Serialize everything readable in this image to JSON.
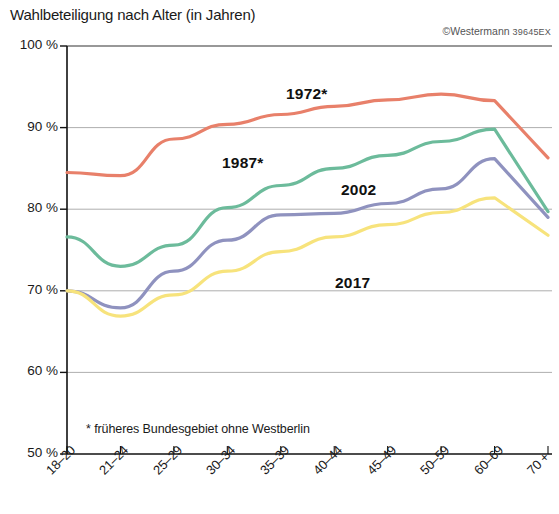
{
  "title": "Wahlbeteiligung nach Alter (in Jahren)",
  "credit": {
    "copy_mark": "©",
    "publisher": "Westermann",
    "code": "39645EX"
  },
  "footnote": "* früheres Bundesgebiet ohne Westberlin",
  "chart_data": {
    "type": "line",
    "title": "Wahlbeteiligung nach Alter (in Jahren)",
    "xlabel": "",
    "ylabel": "",
    "ylim": [
      50,
      100
    ],
    "grid": true,
    "legend_position": "inline-labels",
    "ytick_labels": [
      "100 %",
      "90 %",
      "80 %",
      "70 %",
      "60 %",
      "50 %"
    ],
    "yticks": [
      100,
      90,
      80,
      70,
      60,
      50
    ],
    "categories": [
      "18–20",
      "21–24",
      "25–29",
      "30–34",
      "35–39",
      "40–44",
      "45–49",
      "50–59",
      "60–69",
      "70 +"
    ],
    "series": [
      {
        "name": "1972*",
        "color": "#e8806a",
        "label_x": 286,
        "label_y": 85,
        "values": [
          84.5,
          84.1,
          88.6,
          90.4,
          91.6,
          92.6,
          93.4,
          94.1,
          93.3,
          86.3
        ]
      },
      {
        "name": "1987*",
        "color": "#6cbb9b",
        "label_x": 222,
        "label_y": 154,
        "values": [
          76.6,
          73.0,
          75.6,
          80.2,
          82.9,
          85.0,
          86.6,
          88.3,
          89.8,
          79.7
        ]
      },
      {
        "name": "2002",
        "color": "#8f92bf",
        "label_x": 341,
        "label_y": 181,
        "values": [
          70.0,
          67.9,
          72.4,
          76.2,
          79.3,
          79.5,
          80.7,
          82.5,
          86.2,
          79.0
        ]
      },
      {
        "name": "2017",
        "color": "#f7e37c",
        "label_x": 335,
        "label_y": 274,
        "values": [
          70.0,
          66.9,
          69.5,
          72.4,
          74.8,
          76.6,
          78.1,
          79.6,
          81.4,
          76.8
        ]
      }
    ]
  }
}
